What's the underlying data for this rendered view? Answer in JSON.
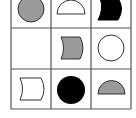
{
  "puzzle": {
    "title": "3x3 shape matrix",
    "grid": {
      "rows": 3,
      "cols": 3,
      "line_color": "#555555"
    },
    "colors": {
      "gray": "#9a9a9a",
      "black": "#000000",
      "white": "#ffffff",
      "stroke": "#333333"
    },
    "cells": [
      {
        "row": 0,
        "col": 0,
        "shape": "circle",
        "fill": "gray"
      },
      {
        "row": 0,
        "col": 1,
        "shape": "semicircle",
        "fill": "white"
      },
      {
        "row": 0,
        "col": 2,
        "shape": "curved-banner",
        "fill": "black"
      },
      {
        "row": 1,
        "col": 0,
        "shape": "empty",
        "fill": "none"
      },
      {
        "row": 1,
        "col": 1,
        "shape": "curved-banner",
        "fill": "gray"
      },
      {
        "row": 1,
        "col": 2,
        "shape": "circle",
        "fill": "white"
      },
      {
        "row": 2,
        "col": 0,
        "shape": "curved-banner",
        "fill": "white"
      },
      {
        "row": 2,
        "col": 1,
        "shape": "circle",
        "fill": "black"
      },
      {
        "row": 2,
        "col": 2,
        "shape": "semicircle",
        "fill": "gray"
      }
    ]
  }
}
